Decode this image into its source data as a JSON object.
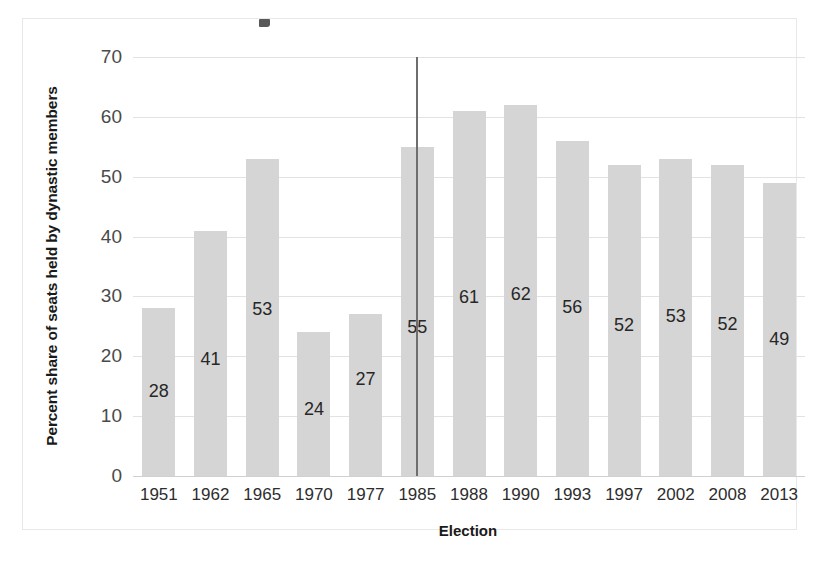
{
  "chart_data": {
    "type": "bar",
    "title": "",
    "xlabel": "Election",
    "ylabel": "Percent share of seats held by dynastic members",
    "categories": [
      "1951",
      "1962",
      "1965",
      "1970",
      "1977",
      "1985",
      "1988",
      "1990",
      "1993",
      "1997",
      "2002",
      "2008",
      "2013"
    ],
    "values": [
      28,
      41,
      53,
      24,
      27,
      55,
      61,
      62,
      56,
      52,
      53,
      52,
      49
    ],
    "value_labels": [
      "28",
      "41",
      "53",
      "24",
      "27",
      "55",
      "61",
      "62",
      "56",
      "52",
      "53",
      "52",
      "49"
    ],
    "ylim": [
      0,
      70
    ],
    "ytick_labels": [
      "0",
      "10",
      "20",
      "30",
      "40",
      "50",
      "60",
      "70"
    ],
    "ytick_values": [
      0,
      10,
      20,
      30,
      40,
      50,
      60,
      70
    ],
    "grid": true,
    "legend": false,
    "bar_color": "#d5d5d5",
    "gridline_color": "#e2e2e2",
    "annotations": [
      {
        "name": "reference-line",
        "category": "1985",
        "description": "vertical reference line drawn at the 1985 election bar, spanning the full plot height"
      }
    ]
  }
}
